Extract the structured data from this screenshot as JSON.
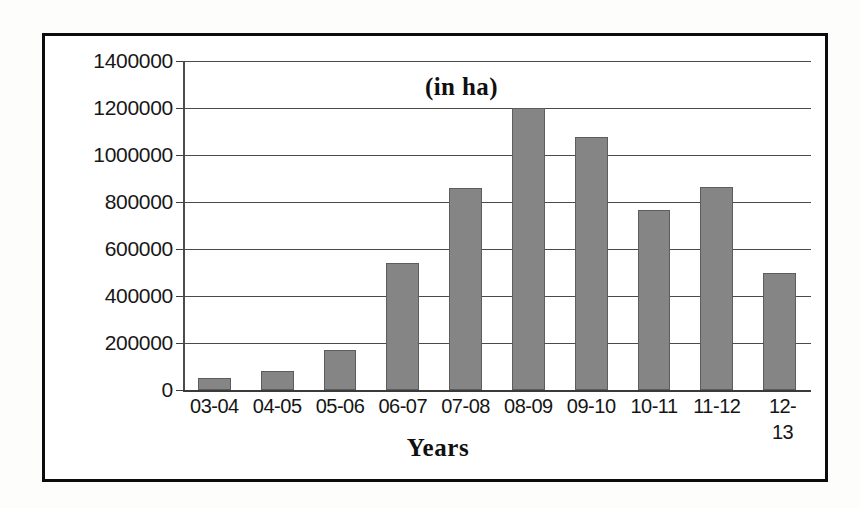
{
  "chart_data": {
    "type": "bar",
    "title": "",
    "annotation": "(in ha)",
    "xlabel": "Years",
    "ylabel": "",
    "categories": [
      "03-04",
      "04-05",
      "05-06",
      "06-07",
      "07-08",
      "08-09",
      "09-10",
      "10-11",
      "11-12",
      "12-13"
    ],
    "values": [
      50000,
      80000,
      170000,
      540000,
      860000,
      1200000,
      1075000,
      765000,
      865000,
      500000
    ],
    "ylim": [
      0,
      1400000
    ],
    "ytick_step": 200000,
    "ytick_labels": [
      "1400000",
      "1200000",
      "1000000",
      "800000",
      "600000",
      "400000",
      "200000",
      "0"
    ],
    "ytick_values": [
      1400000,
      1200000,
      1000000,
      800000,
      600000,
      400000,
      200000,
      0
    ],
    "grid": true,
    "legend": "none",
    "bar_color": "#858585",
    "bar_edge_color": "#5d5d5d",
    "gridline_color": "#4a4a4a",
    "frame_color": "#0c0c0c",
    "background_color": "#ffffff"
  }
}
